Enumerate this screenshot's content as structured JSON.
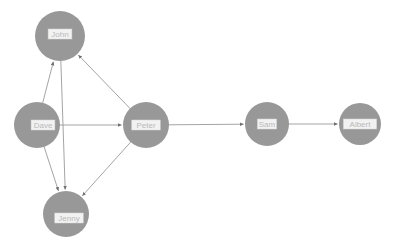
{
  "graph": {
    "type": "directed-node-link-graph",
    "background_color": "#ffffff",
    "node_color": "#989898",
    "edge_color": "#9a9a9a",
    "label_bg_color": "#f2f2f2",
    "label_text_color": "#b9b9b9",
    "nodes": [
      {
        "id": "john",
        "label": "John",
        "x": 60,
        "y": 36,
        "r": 25
      },
      {
        "id": "dave",
        "label": "Dave",
        "x": 37,
        "y": 125,
        "r": 23
      },
      {
        "id": "peter",
        "label": "Peter",
        "x": 146,
        "y": 125,
        "r": 23
      },
      {
        "id": "jenny",
        "label": "Jenny",
        "x": 66,
        "y": 214,
        "r": 23
      },
      {
        "id": "sam",
        "label": "Sam",
        "x": 267,
        "y": 124,
        "r": 22
      },
      {
        "id": "albert",
        "label": "Albert",
        "x": 360,
        "y": 124,
        "r": 21
      }
    ],
    "edges": [
      {
        "source": "dave",
        "target": "john",
        "directed": true
      },
      {
        "source": "peter",
        "target": "john",
        "directed": true
      },
      {
        "source": "dave",
        "target": "peter",
        "directed": true
      },
      {
        "source": "john",
        "target": "jenny",
        "directed": true
      },
      {
        "source": "dave",
        "target": "jenny",
        "directed": true
      },
      {
        "source": "peter",
        "target": "jenny",
        "directed": true
      },
      {
        "source": "peter",
        "target": "sam",
        "directed": true
      },
      {
        "source": "sam",
        "target": "albert",
        "directed": true
      }
    ]
  }
}
